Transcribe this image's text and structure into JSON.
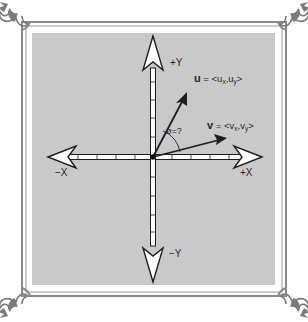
{
  "diagram": {
    "type": "vector-angle-diagram",
    "colors": {
      "background": "#ffffff",
      "panel": "#c9c9c9",
      "frame": "#8a8a8a",
      "axis_fill": "#ffffff",
      "ink": "#1e1e1e"
    },
    "axes": {
      "pos_x_label": "+X",
      "neg_x_label": "−X",
      "pos_y_label": "+Y",
      "neg_y_label": "−Y"
    },
    "vectors": {
      "u": {
        "name": "u",
        "eq": " = <u",
        "sub1": "x",
        "comma": ",u",
        "sub2": "y",
        "close": ">"
      },
      "v": {
        "name": "v",
        "eq": " = <v",
        "sub1": "x",
        "comma": ",v",
        "sub2": "y",
        "close": ">"
      }
    },
    "angle_label": "ø=?"
  }
}
